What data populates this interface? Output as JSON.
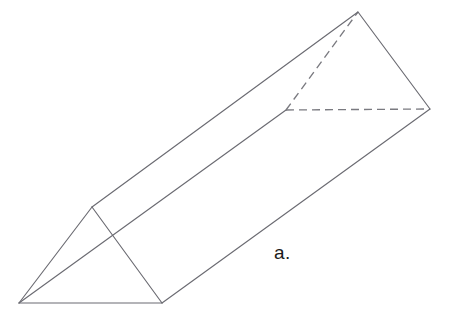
{
  "figure": {
    "kind": "triangular-prism-line-drawing",
    "label": "a.",
    "background_color": "#ffffff",
    "solid_edge_color": "#6b6b72",
    "hidden_edge_color": "#7a7a80",
    "label_color": "#1b1b1b",
    "canvas": {
      "width": 449,
      "height": 335
    },
    "vertices": {
      "front_bottom_left": {
        "x": 19,
        "y": 303
      },
      "front_bottom_right": {
        "x": 162,
        "y": 303
      },
      "front_apex": {
        "x": 92,
        "y": 207
      },
      "back_bottom_left_hidden": {
        "x": 286,
        "y": 110
      },
      "back_bottom_right": {
        "x": 430,
        "y": 109
      },
      "back_apex": {
        "x": 358,
        "y": 12
      }
    },
    "edges": {
      "front_triangle": "19,303 162,303 92,207 19,303",
      "back_triangle_visible": "358,12 430,109",
      "long_edge_top": "92,207 358,12",
      "long_edge_bottom_right": "162,303 430,109",
      "long_edge_bottom_left": "19,303 286,110",
      "hidden_back_left_to_apex": "286,110 358,12",
      "hidden_back_bottom": "286,110 430,109"
    }
  }
}
